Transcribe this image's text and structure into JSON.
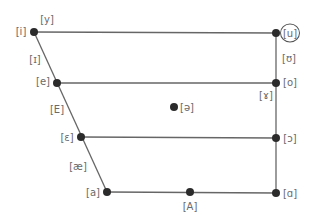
{
  "diagram": {
    "title": "",
    "type": "vowel-quadrilateral",
    "colors": {
      "line": "#666666",
      "dot": "#2b2b2b",
      "label": "#6a6a6a",
      "background": "#ffffff"
    },
    "points": [
      {
        "id": "i",
        "x": 34,
        "y": 32
      },
      {
        "id": "u",
        "x": 276,
        "y": 33
      },
      {
        "id": "e",
        "x": 57,
        "y": 83
      },
      {
        "id": "o",
        "x": 276,
        "y": 83
      },
      {
        "id": "schwa",
        "x": 174,
        "y": 107
      },
      {
        "id": "open-e",
        "x": 81,
        "y": 137
      },
      {
        "id": "open-o",
        "x": 276,
        "y": 138
      },
      {
        "id": "a",
        "x": 107,
        "y": 192
      },
      {
        "id": "A",
        "x": 190,
        "y": 192
      },
      {
        "id": "script-a",
        "x": 276,
        "y": 193
      }
    ],
    "labels": {
      "i": "[i]",
      "y": "[y]",
      "u": "[u]",
      "near_close_front": "[ɪ]",
      "near_close_back": "[ʊ]",
      "e": "[e]",
      "o": "[o]",
      "ram_horn": "[ɤ]",
      "E": "[E]",
      "schwa": "[ə]",
      "open_e": "[ɛ]",
      "open_o": "[ɔ]",
      "ae": "[æ]",
      "a": "[a]",
      "A": "[A]",
      "script_a": "[ɑ]"
    }
  }
}
